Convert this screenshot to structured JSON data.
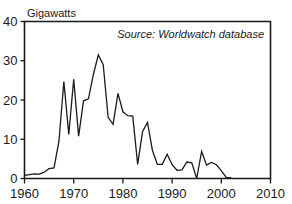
{
  "chart_data": {
    "type": "line",
    "title": "",
    "subtitle": "",
    "xlabel": "",
    "ylabel": "Gigawatts",
    "ylabel_position": "top-left-above-axis",
    "annotation": "Source: Worldwatch database",
    "annotation_position": "top-right-inside-plot",
    "grid": false,
    "legend": null,
    "xlim": [
      1960,
      2010
    ],
    "ylim": [
      0,
      40
    ],
    "xticks": [
      1960,
      1970,
      1980,
      1990,
      2000,
      2010
    ],
    "xtick_labels": [
      "1960",
      "1970",
      "1980",
      "1990",
      "2000",
      "2010"
    ],
    "yticks": [
      0,
      10,
      20,
      30,
      40
    ],
    "ytick_labels": [
      "0",
      "10",
      "20",
      "30",
      "40"
    ],
    "line_color": "#1a1a1a",
    "series": [
      {
        "name": "Nuclear reactor construction starts",
        "x": [
          1960,
          1961,
          1962,
          1963,
          1964,
          1965,
          1966,
          1967,
          1968,
          1969,
          1970,
          1971,
          1972,
          1973,
          1974,
          1975,
          1976,
          1977,
          1978,
          1979,
          1980,
          1981,
          1982,
          1983,
          1984,
          1985,
          1986,
          1987,
          1988,
          1989,
          1990,
          1991,
          1992,
          1993,
          1994,
          1995,
          1996,
          1997,
          1998,
          1999,
          2000,
          2001,
          2002
        ],
        "values": [
          0.8,
          1.0,
          1.2,
          1.1,
          1.6,
          2.5,
          2.7,
          9.5,
          24.7,
          11.2,
          25.3,
          10.8,
          19.8,
          20.3,
          26.5,
          31.5,
          29.0,
          15.6,
          13.8,
          21.7,
          17.0,
          16.0,
          15.9,
          3.6,
          12.0,
          14.3,
          7.2,
          3.6,
          3.6,
          6.2,
          3.5,
          2.1,
          2.2,
          4.2,
          4.0,
          0.0,
          6.9,
          3.4,
          4.1,
          3.5,
          2.0,
          0.3,
          0.2
        ]
      }
    ]
  },
  "figure": {
    "ylabel": "Gigawatts",
    "annotation": "Source: Worldwatch database"
  }
}
